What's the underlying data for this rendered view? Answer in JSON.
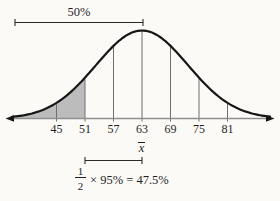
{
  "figure": {
    "top_annotation": {
      "label": "50%"
    },
    "mean": {
      "symbol": "x",
      "display": "x̄"
    },
    "equation": {
      "numerator": "1",
      "denominator": "2",
      "rest": "× 95% = 47.5%",
      "full_text": "1/2 × 95% = 47.5%"
    }
  },
  "chart_data": {
    "type": "area",
    "subtype": "normal-distribution-bell-curve",
    "title": "",
    "xlabel": "",
    "ylabel": "",
    "categories": [
      "45",
      "51",
      "57",
      "63",
      "69",
      "75",
      "81"
    ],
    "x_tick_values": [
      45,
      51,
      57,
      63,
      69,
      75,
      81
    ],
    "mean": 63,
    "mean_label": "x̄",
    "gridlines_at": [
      45,
      51,
      57,
      63,
      69,
      75,
      81
    ],
    "axis": {
      "arrows": "both-ends"
    },
    "shaded_region": {
      "from_x": "left tail",
      "to_x": 51,
      "description": "area under curve left of 51 shaded gray"
    },
    "annotations": [
      {
        "text": "50%",
        "position": "top",
        "span_from": "left edge",
        "span_to": 63
      },
      {
        "text": "1/2 × 95% = 47.5%",
        "position": "bottom",
        "span_from": 51,
        "span_to": 63
      }
    ]
  },
  "colors": {
    "curve": "#161616",
    "shade": "#bcbcbc",
    "axis_line": "#8f8f8f",
    "gridline": "#6f6f6f",
    "bracket": "#2a2a2a",
    "text": "#1f1f1f",
    "background": "#fbfaf7"
  }
}
